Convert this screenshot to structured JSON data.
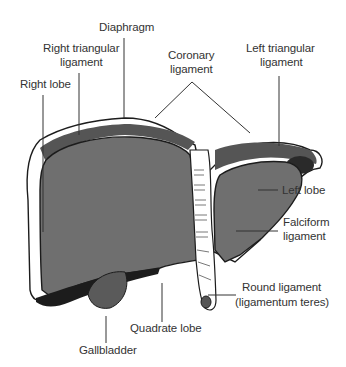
{
  "figure": {
    "colors": {
      "background": "#ffffff",
      "lobe_fill": "#6f6f6f",
      "outline": "#1c1c1c",
      "label_text": "#333333"
    }
  },
  "labels": {
    "diaphragm": "Diaphragm",
    "right_triangular_1": "Right triangular",
    "right_triangular_2": "ligament",
    "coronary_1": "Coronary",
    "coronary_2": "ligament",
    "left_triangular_1": "Left triangular",
    "left_triangular_2": "ligament",
    "right_lobe": "Right lobe",
    "left_lobe": "Left lobe",
    "falciform_1": "Falciform",
    "falciform_2": "ligament",
    "round_1": "Round ligament",
    "round_2": "(ligamentum teres)",
    "quadrate_lobe": "Quadrate lobe",
    "gallbladder": "Gallbladder"
  }
}
